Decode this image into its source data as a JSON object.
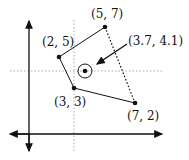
{
  "diagram": {
    "type": "quadrilateral-centroid",
    "points": [
      {
        "label": "(5, 7)",
        "x": 5,
        "y": 7
      },
      {
        "label": "(2, 5)",
        "x": 2,
        "y": 5
      },
      {
        "label": "(3, 3)",
        "x": 3,
        "y": 3
      },
      {
        "label": "(7, 2)",
        "x": 7,
        "y": 2
      }
    ],
    "centroid": {
      "label": "(3.7, 4.1)",
      "x": 3.7,
      "y": 4.1
    },
    "colors": {
      "ink": "#111111",
      "guide": "#999999"
    }
  }
}
